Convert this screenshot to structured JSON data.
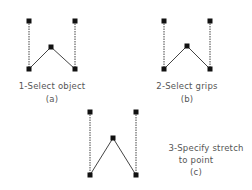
{
  "diagram": {
    "panels": [
      {
        "id": "a",
        "caption_lines": [
          "1-Select object"
        ],
        "tag": "(a)",
        "grips": [
          [
            29,
            21
          ],
          [
            75,
            21
          ],
          [
            51,
            47
          ],
          [
            29,
            69
          ],
          [
            75,
            69
          ]
        ],
        "dashed_segments": [
          [
            [
              29,
              21
            ],
            [
              29,
              69
            ]
          ],
          [
            [
              75,
              21
            ],
            [
              75,
              69
            ]
          ]
        ],
        "solid_segments": [
          [
            [
              29,
              69
            ],
            [
              51,
              47
            ]
          ],
          [
            [
              51,
              47
            ],
            [
              75,
              69
            ]
          ]
        ]
      },
      {
        "id": "b",
        "caption_lines": [
          "2-Select grips"
        ],
        "tag": "(b)",
        "grips": [
          [
            164,
            21
          ],
          [
            210,
            21
          ],
          [
            187,
            46
          ],
          [
            164,
            69
          ],
          [
            210,
            69
          ]
        ],
        "dashed_segments": [
          [
            [
              164,
              21
            ],
            [
              164,
              69
            ]
          ],
          [
            [
              210,
              21
            ],
            [
              210,
              69
            ]
          ]
        ],
        "solid_segments": [
          [
            [
              164,
              69
            ],
            [
              187,
              46
            ]
          ],
          [
            [
              187,
              46
            ],
            [
              210,
              69
            ]
          ]
        ]
      },
      {
        "id": "c",
        "caption_lines": [
          "3-Specify stretch",
          "to point"
        ],
        "tag": "(c)",
        "grips": [
          [
            90,
            112
          ],
          [
            136,
            112
          ],
          [
            113,
            138
          ],
          [
            90,
            175
          ],
          [
            136,
            175
          ]
        ],
        "dashed_segments": [
          [
            [
              90,
              112
            ],
            [
              90,
              175
            ]
          ],
          [
            [
              136,
              112
            ],
            [
              136,
              175
            ]
          ]
        ],
        "solid_segments": [
          [
            [
              90,
              175
            ],
            [
              113,
              138
            ]
          ],
          [
            [
              113,
              138
            ],
            [
              136,
              175
            ]
          ]
        ]
      }
    ],
    "colors": {
      "line": "#444444",
      "grip": "#111111",
      "text": "#555555"
    }
  }
}
